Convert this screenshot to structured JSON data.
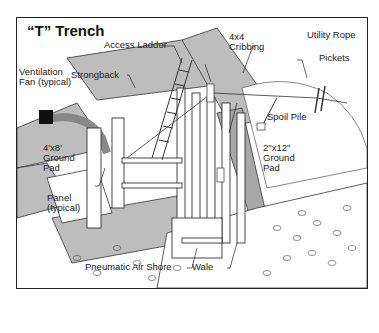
{
  "diagram": {
    "title": "“T” Trench",
    "labels": {
      "access_ladder": "Access Ladder",
      "cribbing": "4x4\nCribbing",
      "utility_rope": "Utility Rope",
      "pickets": "Pickets",
      "ventilation_fan": "Ventilation\nFan (typical)",
      "strongback": "Strongback",
      "spoil_pile": "Spoil Pile",
      "ground_pad_4x8": "4'x8'\nGround\nPad",
      "ground_pad_2x12": "2\"x12\"\nGround\nPad",
      "panel": "Panel\n(typical)",
      "pneumatic_air_shore": "Pneumatic Air Shore",
      "wale": "Wale"
    },
    "colors": {
      "pad_gray": "#bdbdbd",
      "line": "#222222",
      "background": "#ffffff"
    }
  }
}
